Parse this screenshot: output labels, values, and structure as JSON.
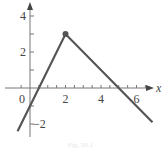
{
  "chart_data": {
    "type": "line",
    "title": "",
    "xlabel": "x",
    "ylabel": "",
    "xlim": [
      -1,
      7
    ],
    "ylim": [
      -2.6,
      4.7
    ],
    "grid": false,
    "legend": null,
    "x_ticks": [
      0,
      2,
      4,
      6
    ],
    "x_tick_labels": [
      "0",
      "2",
      "4",
      "6"
    ],
    "x_minor_ticks": [
      -0.5,
      0.5,
      1,
      1.5,
      2.5,
      3,
      3.5,
      4.5,
      5,
      5.5,
      6.5
    ],
    "y_ticks": [
      -2,
      2,
      4
    ],
    "y_tick_labels": [
      "−2",
      "2",
      "4"
    ],
    "y_minor_ticks": [
      -1,
      1,
      3
    ],
    "series": [
      {
        "name": "f(x)",
        "points": [
          [
            -0.7,
            -2.4
          ],
          [
            2,
            3
          ],
          [
            6.9,
            -1.9
          ]
        ],
        "color": "#555555"
      }
    ],
    "annotations": [
      {
        "type": "filled-point",
        "x": 2,
        "y": 3
      }
    ],
    "caption": "Fig. 20.1"
  },
  "labels": {
    "x_axis": "x",
    "caption": "Fig. 20.1"
  }
}
